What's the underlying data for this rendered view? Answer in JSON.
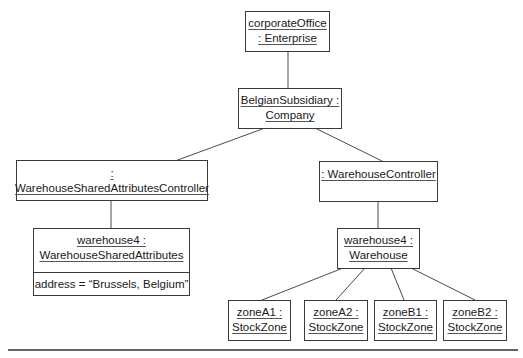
{
  "diagram": {
    "type": "UML object diagram",
    "nodes": [
      {
        "id": "corporateOffice",
        "line1": "corporateOffice",
        "line2": ": Enterprise"
      },
      {
        "id": "belgianSubsidiary",
        "line1": "BelgianSubsidiary :",
        "line2": "Company"
      },
      {
        "id": "sharedAttrController",
        "line1": ": WarehouseSharedAttributesController"
      },
      {
        "id": "warehouseController",
        "line1": ": WarehouseController"
      },
      {
        "id": "warehouseSharedAttrs",
        "line1": "warehouse4 :",
        "line2": "WarehouseSharedAttributes",
        "attribute": "address = “Brussels, Belgium”"
      },
      {
        "id": "warehouse",
        "line1": "warehouse4 :",
        "line2": "Warehouse"
      },
      {
        "id": "zoneA1",
        "line1": "zoneA1 :",
        "line2": "StockZone"
      },
      {
        "id": "zoneA2",
        "line1": "zoneA2 :",
        "line2": "StockZone"
      },
      {
        "id": "zoneB1",
        "line1": "zoneB1 :",
        "line2": "StockZone"
      },
      {
        "id": "zoneB2",
        "line1": "zoneB2 :",
        "line2": "StockZone"
      }
    ],
    "links": [
      [
        "corporateOffice",
        "belgianSubsidiary"
      ],
      [
        "belgianSubsidiary",
        "sharedAttrController"
      ],
      [
        "belgianSubsidiary",
        "warehouseController"
      ],
      [
        "sharedAttrController",
        "warehouseSharedAttrs"
      ],
      [
        "warehouseController",
        "warehouse"
      ],
      [
        "warehouse",
        "zoneA1"
      ],
      [
        "warehouse",
        "zoneA2"
      ],
      [
        "warehouse",
        "zoneB1"
      ],
      [
        "warehouse",
        "zoneB2"
      ]
    ]
  }
}
